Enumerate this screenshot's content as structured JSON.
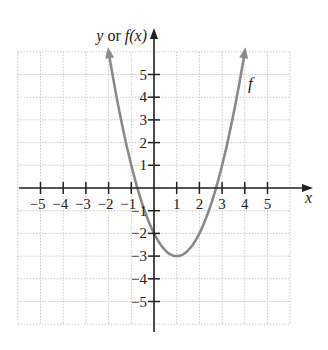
{
  "chart_data": {
    "type": "line",
    "title": "",
    "function": "f(x) = (x - 1)^2 - 3",
    "series": [
      {
        "name": "f",
        "x": [
          -2.03,
          -1.5,
          -1,
          -0.73,
          -0.5,
          0,
          0.5,
          1,
          1.5,
          2,
          2.5,
          2.73,
          3,
          3.5,
          4.03
        ],
        "values": [
          6.2,
          3.25,
          1,
          0,
          -0.75,
          -2,
          -2.75,
          -3,
          -2.75,
          -2,
          -0.75,
          0,
          1,
          3.25,
          6.2
        ],
        "color": "#8a8a8a"
      }
    ],
    "xlabel": "x",
    "ylabel": "y or f(x)",
    "xlim": [
      -6,
      6
    ],
    "ylim": [
      -6,
      6
    ],
    "xticks": [
      -5,
      -4,
      -3,
      -2,
      -1,
      1,
      2,
      3,
      4,
      5
    ],
    "yticks": [
      -5,
      -4,
      -3,
      -2,
      -1,
      1,
      2,
      3,
      4,
      5
    ],
    "grid": true,
    "annotations": [
      {
        "text": "f",
        "x": 4.3,
        "y": 4.6
      }
    ],
    "key_points": {
      "vertex": [
        1,
        -3
      ],
      "y_intercept": [
        0,
        -2
      ],
      "x_intercepts": [
        -0.73,
        2.73
      ]
    }
  },
  "labels": {
    "y_axis_prefix": "y or ",
    "y_axis_fn": "f(x)",
    "x_axis": "x",
    "curve": "f"
  },
  "colors": {
    "curve": "#8a8a8a",
    "axis": "#222222",
    "grid": "#c8c8c8"
  }
}
